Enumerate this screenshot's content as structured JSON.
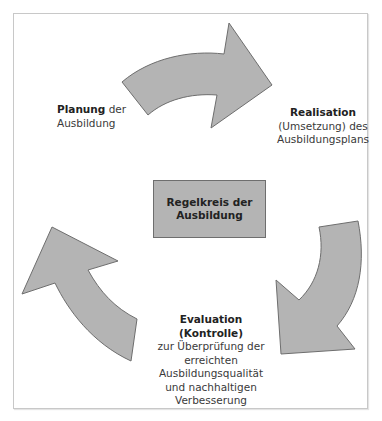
{
  "diagram": {
    "center": {
      "line1": "Regelkreis der",
      "line2": "Ausbildung"
    },
    "planung": {
      "bold": "Planung",
      "rest": " der",
      "line2": "Ausbildung"
    },
    "realisation": {
      "bold": "Realisation",
      "line2": "(Umsetzung) des",
      "line3": "Ausbildungsplans"
    },
    "evaluation": {
      "bold1": "Evaluation",
      "bold2": "(Kontrolle)",
      "line3": "zur Überprüfung der",
      "line4": "erreichten",
      "line5": "Ausbildungsqualität",
      "line6": "und nachhaltigen",
      "line7": "Verbesserung"
    },
    "arrows": [
      "top-arrow-right",
      "right-arrow-down",
      "left-arrow-up"
    ],
    "colors": {
      "fill": "#b4b4b4",
      "stroke": "#6e6e6e",
      "frame": "#c8c8c8"
    }
  }
}
